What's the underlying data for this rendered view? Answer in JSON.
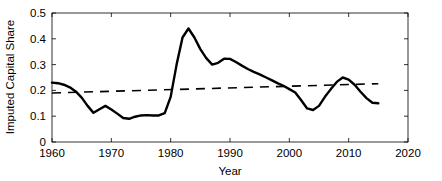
{
  "chart_data": {
    "type": "line",
    "title": "",
    "xlabel": "Year",
    "ylabel": "Imputed Capital Share",
    "xlim": [
      1960,
      2020
    ],
    "ylim": [
      0,
      0.5
    ],
    "xticks": [
      1960,
      1970,
      1980,
      1990,
      2000,
      2010,
      2020
    ],
    "xtick_labels": [
      "1960",
      "1970",
      "1980",
      "1990",
      "2000",
      "2010",
      "2020"
    ],
    "yticks": [
      0,
      0.1,
      0.2,
      0.3,
      0.4,
      0.5
    ],
    "ytick_labels": [
      "0",
      "0.1",
      "0.2",
      "0.3",
      "0.4",
      "0.5"
    ],
    "grid": false,
    "legend": "none",
    "series": [
      {
        "name": "Imputed Capital Share",
        "style": "solid",
        "color": "#000000",
        "x": [
          1960,
          1961,
          1962,
          1963,
          1964,
          1965,
          1966,
          1967,
          1968,
          1969,
          1970,
          1971,
          1972,
          1973,
          1974,
          1975,
          1976,
          1977,
          1978,
          1979,
          1980,
          1981,
          1982,
          1983,
          1984,
          1985,
          1986,
          1987,
          1988,
          1989,
          1990,
          1991,
          1992,
          1993,
          1994,
          1995,
          1996,
          1997,
          1998,
          1999,
          2000,
          2001,
          2002,
          2003,
          2004,
          2005,
          2006,
          2007,
          2008,
          2009,
          2010,
          2011,
          2012,
          2013,
          2014,
          2015
        ],
        "values": [
          0.23,
          0.228,
          0.222,
          0.212,
          0.196,
          0.172,
          0.14,
          0.113,
          0.127,
          0.14,
          0.126,
          0.11,
          0.093,
          0.09,
          0.098,
          0.103,
          0.104,
          0.103,
          0.103,
          0.112,
          0.175,
          0.3,
          0.405,
          0.44,
          0.405,
          0.36,
          0.325,
          0.3,
          0.307,
          0.323,
          0.322,
          0.31,
          0.296,
          0.283,
          0.272,
          0.262,
          0.251,
          0.24,
          0.228,
          0.218,
          0.205,
          0.192,
          0.162,
          0.13,
          0.124,
          0.14,
          0.175,
          0.205,
          0.233,
          0.25,
          0.242,
          0.222,
          0.195,
          0.17,
          0.152,
          0.15
        ]
      },
      {
        "name": "Trend",
        "style": "dashed",
        "color": "#000000",
        "x": [
          1960,
          2015
        ],
        "values": [
          0.19,
          0.226
        ]
      }
    ]
  }
}
